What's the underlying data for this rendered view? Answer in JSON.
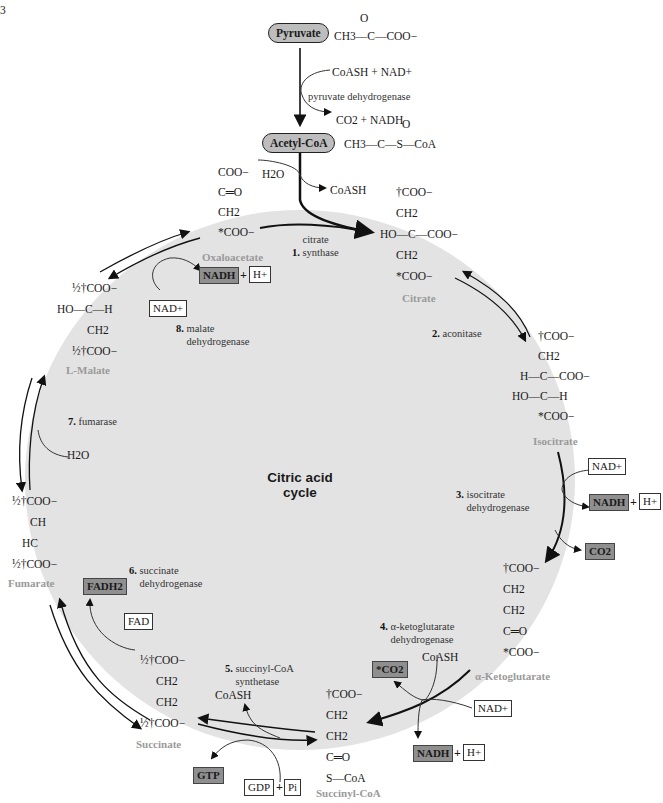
{
  "figure_marker": "3",
  "title": {
    "line1": "Citric acid",
    "line2": "cycle"
  },
  "entry": {
    "pyruvate": {
      "label": "Pyruvate",
      "formula": "CH3—C—COO−",
      "carbonyl": "O"
    },
    "pdh": {
      "inputs": "CoASH + NAD+",
      "enzyme": "pyruvate dehydrogenase",
      "outputs": "CO2 + NADH"
    },
    "acetyl_coa": {
      "label": "Acetyl-CoA",
      "formula": "CH3—C—S—CoA",
      "carbonyl": "O"
    },
    "water_in": "H2O",
    "coash_out": "CoASH"
  },
  "metabolites": {
    "oxaloacetate": {
      "name": "Oxaloacetate",
      "lines": [
        "COO−",
        "C═O",
        "CH2",
        "*COO−"
      ]
    },
    "citrate": {
      "name": "Citrate",
      "lines": [
        "†COO−",
        "CH2",
        "HO—C—COO−",
        "CH2",
        "*COO−"
      ]
    },
    "isocitrate": {
      "name": "Isocitrate",
      "lines": [
        "†COO−",
        "CH2",
        "H—C—COO−",
        "HO—C—H",
        "*COO−"
      ]
    },
    "alpha_ketoglutarate": {
      "name": "α-Ketoglutarate",
      "lines": [
        "†COO−",
        "CH2",
        "CH2",
        "C═O",
        "*COO−"
      ]
    },
    "succinyl_coa": {
      "name": "Succinyl-CoA",
      "lines": [
        "†COO−",
        "CH2",
        "CH2",
        "C═O",
        "S—CoA"
      ]
    },
    "succinate": {
      "name": "Succinate",
      "lines": [
        "½†COO−",
        "CH2",
        "CH2",
        "½†COO−"
      ]
    },
    "fumarate": {
      "name": "Fumarate",
      "lines": [
        "½†COO−",
        "CH",
        "HC",
        "½†COO−"
      ]
    },
    "malate": {
      "name": "L-Malate",
      "lines": [
        "½†COO−",
        "HO—C—H",
        "CH2",
        "½†COO−"
      ]
    }
  },
  "enzymes": [
    {
      "step": "1.",
      "name": "citrate synthase"
    },
    {
      "step": "2.",
      "name": "aconitase"
    },
    {
      "step": "3.",
      "name": "isocitrate dehydrogenase"
    },
    {
      "step": "4.",
      "name": "α-ketoglutarate dehydrogenase"
    },
    {
      "step": "5.",
      "name": "succinyl-CoA synthetase"
    },
    {
      "step": "6.",
      "name": "succinate dehydrogenase"
    },
    {
      "step": "7.",
      "name": "fumarase"
    },
    {
      "step": "8.",
      "name": "malate dehydrogenase"
    }
  ],
  "cofactors": {
    "step3": {
      "in": "NAD+",
      "out": "NADH",
      "h": "H+",
      "co2": "CO2"
    },
    "step4": {
      "coash": "CoASH",
      "co2": "*CO2",
      "in": "NAD+",
      "out": "NADH",
      "h": "H+"
    },
    "step5": {
      "coash": "CoASH",
      "gtp": "GTP",
      "gdp": "GDP",
      "pi": "Pi"
    },
    "step6": {
      "in": "FAD",
      "out": "FADH2"
    },
    "step7": {
      "water": "H2O"
    },
    "step8": {
      "in": "NAD+",
      "out": "NADH",
      "h": "H+"
    }
  },
  "colors": {
    "cycle_fill": "#e3e3e3",
    "product_box": "#8f8f8f",
    "pill": "#bdbdbd",
    "name_gray": "#9a9a9a"
  }
}
